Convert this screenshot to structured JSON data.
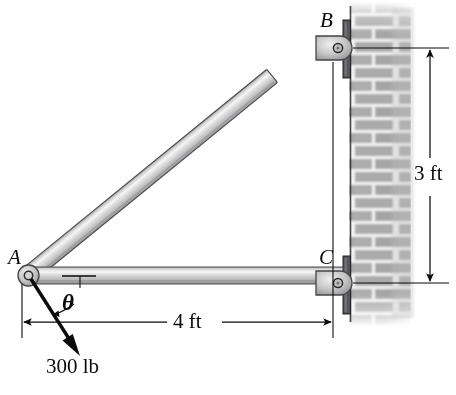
{
  "figure": {
    "type": "statics-free-body-diagram"
  },
  "joints": [
    {
      "id": "A",
      "label": "A",
      "x": 28,
      "y": 275,
      "support": "pin-connection-at-free-end"
    },
    {
      "id": "B",
      "label": "B",
      "x": 338,
      "y": 48,
      "support": "pin-support-on-wall"
    },
    {
      "id": "C",
      "label": "C",
      "x": 338,
      "y": 283,
      "support": "pin-support-on-wall"
    }
  ],
  "members": [
    {
      "id": "AB",
      "from": "A",
      "to": "B",
      "name": "diagonal-member-ab"
    },
    {
      "id": "AC",
      "from": "A",
      "to": "C",
      "name": "horizontal-member-ac"
    }
  ],
  "dimensions": [
    {
      "id": "horizontal",
      "label": "4 ft",
      "value": 4,
      "unit": "ft",
      "orientation": "horizontal",
      "measures": "A-to-C"
    },
    {
      "id": "vertical",
      "label": "3 ft",
      "value": 3,
      "unit": "ft",
      "orientation": "vertical",
      "measures": "B-to-C"
    }
  ],
  "load": {
    "label": "300 lb",
    "magnitude": 300,
    "unit": "lb",
    "applied_at": "A",
    "direction": "down-and-to-the-left"
  },
  "angle": {
    "label": "θ",
    "symbol": "theta",
    "between": "member-AC and 300 lb force"
  },
  "wall": {
    "material": "brick",
    "position": "right"
  },
  "colors": {
    "ink": "#0b0b0b",
    "member_fill": "#c9c9c9",
    "member_highlight": "#ececed",
    "member_edge": "#58585a",
    "brick": "#a8a8a8",
    "mortar": "#efefef",
    "plate": "#4a4a4c",
    "background": "#ffffff"
  }
}
